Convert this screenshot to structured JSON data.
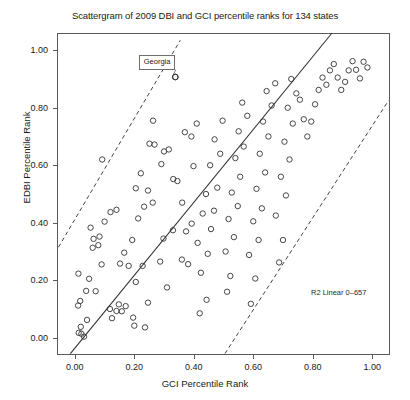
{
  "chart_data": {
    "type": "scatter",
    "title": "Scattergram of 2009 DBI and GCI percentile ranks for 134 states",
    "xlabel": "GCI Percentile Rank",
    "ylabel": "EDBI Percentile Rank",
    "xlim": [
      -0.06,
      1.06
    ],
    "ylim": [
      -0.06,
      1.06
    ],
    "grid": false,
    "legend": null,
    "n_points": 134,
    "xticks": [
      0.0,
      0.2,
      0.4,
      0.6,
      0.8,
      1.0
    ],
    "yticks": [
      0.0,
      0.2,
      0.4,
      0.6,
      0.8,
      1.0
    ],
    "xtick_labels": [
      "0.00",
      "0.20",
      "0.40",
      "0.60",
      "0.80",
      "1.00"
    ],
    "ytick_labels": [
      "0.00",
      "0.20",
      "0.40",
      "0.60",
      "0.80",
      "1.00"
    ],
    "marker": "open-circle",
    "marker_color": "#333333",
    "annotations": [
      {
        "name": "r2-linear",
        "text": "R2 Linear 0–657",
        "x": 0.78,
        "y": 0.21
      },
      {
        "name": "georgia-callout",
        "text": "Georgia",
        "x": 0.215,
        "y": 0.985,
        "point_x": 0.338,
        "point_y": 0.907
      }
    ],
    "fit_line": {
      "name": "linear-fit",
      "style": "solid",
      "color": "#333333",
      "x0": -0.015,
      "y0": -0.055,
      "x1": 0.865,
      "y1": 1.06
    },
    "bands": [
      {
        "name": "upper-band",
        "style": "dashed",
        "color": "#444444",
        "x0": -0.055,
        "y0": 0.315,
        "x1": 0.355,
        "y1": 1.035
      },
      {
        "name": "lower-band",
        "style": "dashed",
        "color": "#444444",
        "x0": 0.505,
        "y0": -0.055,
        "x1": 1.055,
        "y1": 0.825
      }
    ],
    "points": [
      [
        0.013,
        0.017
      ],
      [
        0.022,
        0.014
      ],
      [
        0.02,
        0.038
      ],
      [
        0.031,
        0.004
      ],
      [
        0.041,
        0.062
      ],
      [
        0.011,
        0.112
      ],
      [
        0.018,
        0.128
      ],
      [
        0.012,
        0.223
      ],
      [
        0.048,
        0.205
      ],
      [
        0.038,
        0.163
      ],
      [
        0.07,
        0.162
      ],
      [
        0.09,
        0.255
      ],
      [
        0.06,
        0.313
      ],
      [
        0.079,
        0.322
      ],
      [
        0.063,
        0.344
      ],
      [
        0.083,
        0.352
      ],
      [
        0.053,
        0.383
      ],
      [
        0.1,
        0.404
      ],
      [
        0.12,
        0.437
      ],
      [
        0.14,
        0.445
      ],
      [
        0.092,
        0.62
      ],
      [
        0.118,
        0.1
      ],
      [
        0.125,
        0.068
      ],
      [
        0.148,
        0.116
      ],
      [
        0.14,
        0.093
      ],
      [
        0.158,
        0.092
      ],
      [
        0.171,
        0.11
      ],
      [
        0.152,
        0.258
      ],
      [
        0.166,
        0.296
      ],
      [
        0.2,
        0.042
      ],
      [
        0.196,
        0.07
      ],
      [
        0.181,
        0.25
      ],
      [
        0.193,
        0.34
      ],
      [
        0.236,
        0.036
      ],
      [
        0.205,
        0.194
      ],
      [
        0.228,
        0.25
      ],
      [
        0.246,
        0.122
      ],
      [
        0.213,
        0.415
      ],
      [
        0.233,
        0.456
      ],
      [
        0.205,
        0.52
      ],
      [
        0.246,
        0.512
      ],
      [
        0.222,
        0.572
      ],
      [
        0.262,
        0.47
      ],
      [
        0.251,
        0.675
      ],
      [
        0.268,
        0.672
      ],
      [
        0.263,
        0.755
      ],
      [
        0.338,
        0.907
      ],
      [
        0.287,
        0.265
      ],
      [
        0.31,
        0.175
      ],
      [
        0.298,
        0.345
      ],
      [
        0.33,
        0.374
      ],
      [
        0.291,
        0.604
      ],
      [
        0.316,
        0.655
      ],
      [
        0.3,
        0.648
      ],
      [
        0.345,
        0.545
      ],
      [
        0.331,
        0.552
      ],
      [
        0.36,
        0.272
      ],
      [
        0.381,
        0.256
      ],
      [
        0.374,
        0.37
      ],
      [
        0.393,
        0.397
      ],
      [
        0.361,
        0.47
      ],
      [
        0.399,
        0.597
      ],
      [
        0.37,
        0.715
      ],
      [
        0.392,
        0.7
      ],
      [
        0.41,
        0.745
      ],
      [
        0.42,
        0.085
      ],
      [
        0.443,
        0.132
      ],
      [
        0.424,
        0.226
      ],
      [
        0.447,
        0.292
      ],
      [
        0.413,
        0.33
      ],
      [
        0.458,
        0.378
      ],
      [
        0.43,
        0.432
      ],
      [
        0.468,
        0.442
      ],
      [
        0.441,
        0.5
      ],
      [
        0.479,
        0.522
      ],
      [
        0.455,
        0.6
      ],
      [
        0.489,
        0.64
      ],
      [
        0.47,
        0.69
      ],
      [
        0.497,
        0.755
      ],
      [
        0.512,
        0.16
      ],
      [
        0.523,
        0.215
      ],
      [
        0.507,
        0.3
      ],
      [
        0.535,
        0.35
      ],
      [
        0.517,
        0.413
      ],
      [
        0.548,
        0.458
      ],
      [
        0.528,
        0.505
      ],
      [
        0.556,
        0.56
      ],
      [
        0.54,
        0.625
      ],
      [
        0.568,
        0.665
      ],
      [
        0.551,
        0.718
      ],
      [
        0.58,
        0.772
      ],
      [
        0.563,
        0.818
      ],
      [
        0.592,
        0.118
      ],
      [
        0.607,
        0.206
      ],
      [
        0.586,
        0.288
      ],
      [
        0.618,
        0.34
      ],
      [
        0.6,
        0.405
      ],
      [
        0.629,
        0.45
      ],
      [
        0.611,
        0.518
      ],
      [
        0.64,
        0.575
      ],
      [
        0.622,
        0.64
      ],
      [
        0.651,
        0.7
      ],
      [
        0.633,
        0.752
      ],
      [
        0.662,
        0.808
      ],
      [
        0.645,
        0.858
      ],
      [
        0.674,
        0.885
      ],
      [
        0.687,
        0.262
      ],
      [
        0.7,
        0.34
      ],
      [
        0.676,
        0.425
      ],
      [
        0.71,
        0.495
      ],
      [
        0.693,
        0.56
      ],
      [
        0.722,
        0.62
      ],
      [
        0.705,
        0.682
      ],
      [
        0.733,
        0.745
      ],
      [
        0.716,
        0.8
      ],
      [
        0.745,
        0.85
      ],
      [
        0.728,
        0.9
      ],
      [
        0.757,
        0.828
      ],
      [
        0.77,
        0.76
      ],
      [
        0.782,
        0.7
      ],
      [
        0.795,
        0.752
      ],
      [
        0.808,
        0.812
      ],
      [
        0.82,
        0.862
      ],
      [
        0.833,
        0.905
      ],
      [
        0.846,
        0.88
      ],
      [
        0.858,
        0.93
      ],
      [
        0.871,
        0.952
      ],
      [
        0.884,
        0.905
      ],
      [
        0.896,
        0.862
      ],
      [
        0.909,
        0.89
      ],
      [
        0.921,
        0.93
      ],
      [
        0.934,
        0.962
      ],
      [
        0.946,
        0.932
      ],
      [
        0.959,
        0.902
      ],
      [
        0.971,
        0.96
      ],
      [
        0.984,
        0.94
      ]
    ]
  }
}
